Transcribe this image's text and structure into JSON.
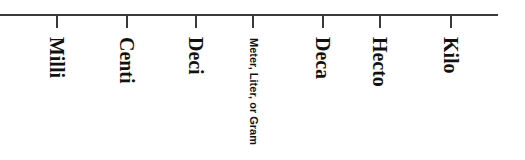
{
  "diagram": {
    "type": "metric-prefix-number-line",
    "line_color": "#3a3a3a",
    "text_color": "#111111",
    "ticks": [
      {
        "label": "Milli",
        "x": 57
      },
      {
        "label": "Centi",
        "x": 127
      },
      {
        "label": "Deci",
        "x": 196
      },
      {
        "label": "Meter, Liter, or Gram",
        "x": 253
      },
      {
        "label": "Deca",
        "x": 323
      },
      {
        "label": "Hecto",
        "x": 380
      },
      {
        "label": "Kilo",
        "x": 451
      }
    ]
  }
}
